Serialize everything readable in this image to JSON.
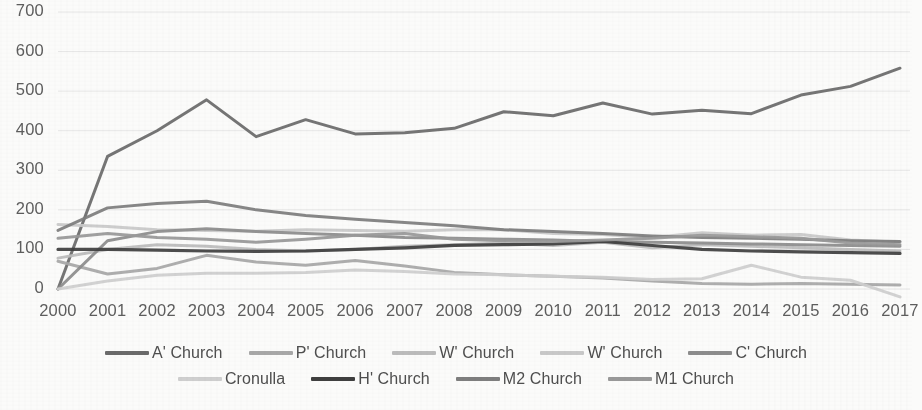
{
  "chart_data": {
    "type": "line",
    "title": "",
    "subtitle": "",
    "xlabel": "",
    "ylabel": "",
    "grid": true,
    "legend_position": "bottom",
    "xlim": [
      2000,
      2017
    ],
    "ylim": [
      0,
      700
    ],
    "ytick_step": 100,
    "yticks": [
      "0",
      "100",
      "200",
      "300",
      "400",
      "500",
      "600",
      "700"
    ],
    "categories": [
      "2000",
      "2001",
      "2002",
      "2003",
      "2004",
      "2005",
      "2006",
      "2007",
      "2008",
      "2009",
      "2010",
      "2011",
      "2012",
      "2013",
      "2014",
      "2015",
      "2016",
      "2017"
    ],
    "series": [
      {
        "name": "A' Church",
        "color": "#6b6b6b",
        "width": 3.0,
        "values": [
          0,
          335,
          400,
          478,
          385,
          428,
          392,
          395,
          406,
          448,
          438,
          470,
          442,
          452,
          443,
          490,
          512,
          558
        ]
      },
      {
        "name": "P' Church",
        "color": "#a8a8a8",
        "width": 3.0,
        "values": [
          70,
          38,
          52,
          85,
          68,
          60,
          72,
          58,
          42,
          36,
          32,
          28,
          20,
          14,
          12,
          14,
          12,
          10
        ]
      },
      {
        "name": "W' Church",
        "color": "#bcbcbc",
        "width": 3.0,
        "values": [
          78,
          100,
          112,
          108,
          100,
          96,
          100,
          108,
          112,
          116,
          110,
          118,
          104,
          112,
          108,
          104,
          100,
          96
        ]
      },
      {
        "name": "W' Church",
        "color": "#c9c9c9",
        "width": 3.0,
        "values": [
          163,
          158,
          150,
          148,
          146,
          150,
          148,
          146,
          150,
          150,
          140,
          138,
          130,
          142,
          136,
          138,
          124,
          118
        ]
      },
      {
        "name": "C' Church",
        "color": "#8d8d8d",
        "width": 3.0,
        "values": [
          0,
          122,
          145,
          152,
          145,
          140,
          136,
          130,
          128,
          126,
          124,
          120,
          118,
          116,
          114,
          112,
          110,
          108
        ]
      },
      {
        "name": "Cronulla",
        "color": "#cfcfcf",
        "width": 3.0,
        "values": [
          0,
          20,
          35,
          40,
          40,
          42,
          48,
          44,
          38,
          36,
          32,
          30,
          24,
          26,
          60,
          30,
          22,
          -20
        ]
      },
      {
        "name": "H' Church",
        "color": "#3f3f3f",
        "width": 3.2,
        "values": [
          100,
          100,
          98,
          96,
          95,
          96,
          100,
          104,
          110,
          112,
          114,
          120,
          110,
          100,
          96,
          94,
          92,
          90
        ]
      },
      {
        "name": "M2 Church",
        "color": "#7e7e7e",
        "width": 3.0,
        "values": [
          148,
          205,
          216,
          222,
          200,
          186,
          176,
          168,
          160,
          150,
          145,
          140,
          134,
          130,
          128,
          126,
          122,
          120
        ]
      },
      {
        "name": "M1 Church",
        "color": "#999999",
        "width": 3.0,
        "values": [
          128,
          140,
          130,
          126,
          118,
          126,
          136,
          140,
          126,
          122,
          120,
          124,
          128,
          136,
          132,
          128,
          116,
          112
        ]
      }
    ]
  },
  "legend": {
    "row1": [
      {
        "label": "A' Church",
        "color": "#6b6b6b"
      },
      {
        "label": "P' Church",
        "color": "#a8a8a8"
      },
      {
        "label": "W' Church",
        "color": "#bcbcbc"
      },
      {
        "label": "W' Church",
        "color": "#c9c9c9"
      },
      {
        "label": "C' Church",
        "color": "#8d8d8d"
      }
    ],
    "row2": [
      {
        "label": "Cronulla",
        "color": "#cfcfcf"
      },
      {
        "label": "H' Church",
        "color": "#3f3f3f"
      },
      {
        "label": "M2 Church",
        "color": "#7e7e7e"
      },
      {
        "label": "M1 Church",
        "color": "#999999"
      }
    ]
  },
  "style": {
    "background": "#fbfbfa",
    "gridline_color": "#e6e6e6",
    "tick_text_color": "#5d5d5d"
  }
}
